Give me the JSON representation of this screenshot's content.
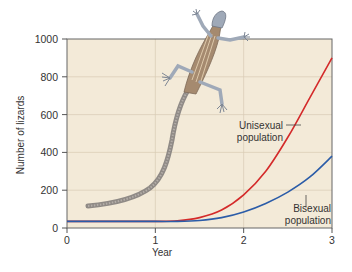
{
  "chart_data": {
    "type": "line",
    "title": "",
    "xlabel": "Year",
    "ylabel": "Number of lizards",
    "xlim": [
      0,
      3
    ],
    "ylim": [
      0,
      1000
    ],
    "x_ticks": [
      "0",
      "1",
      "2",
      "3"
    ],
    "y_ticks": [
      "0",
      "200",
      "400",
      "600",
      "800",
      "1000"
    ],
    "grid": true,
    "legend": "none (inline annotations)",
    "x": [
      0,
      0.5,
      1.0,
      1.25,
      1.5,
      1.75,
      2.0,
      2.25,
      2.5,
      2.75,
      3.0
    ],
    "series": [
      {
        "name": "Unisexual population",
        "color": "#d42a2a",
        "values": [
          35,
          35,
          35,
          38,
          55,
          95,
          175,
          300,
          480,
          690,
          900
        ]
      },
      {
        "name": "Bisexual population",
        "color": "#2b5ca8",
        "values": [
          35,
          35,
          35,
          35,
          40,
          55,
          85,
          130,
          190,
          270,
          380
        ]
      }
    ],
    "annotations": [
      {
        "text_lines": [
          "Unisexual",
          "population"
        ],
        "target_series": "Unisexual population"
      },
      {
        "text_lines": [
          "Bisexual",
          "population"
        ],
        "target_series": "Bisexual population"
      }
    ],
    "illustration": "whiptail lizard drawing overlaid on plot"
  },
  "colors": {
    "plot_background": "#f3ead8",
    "grid": "#d8ccb4",
    "axis": "#555555"
  }
}
